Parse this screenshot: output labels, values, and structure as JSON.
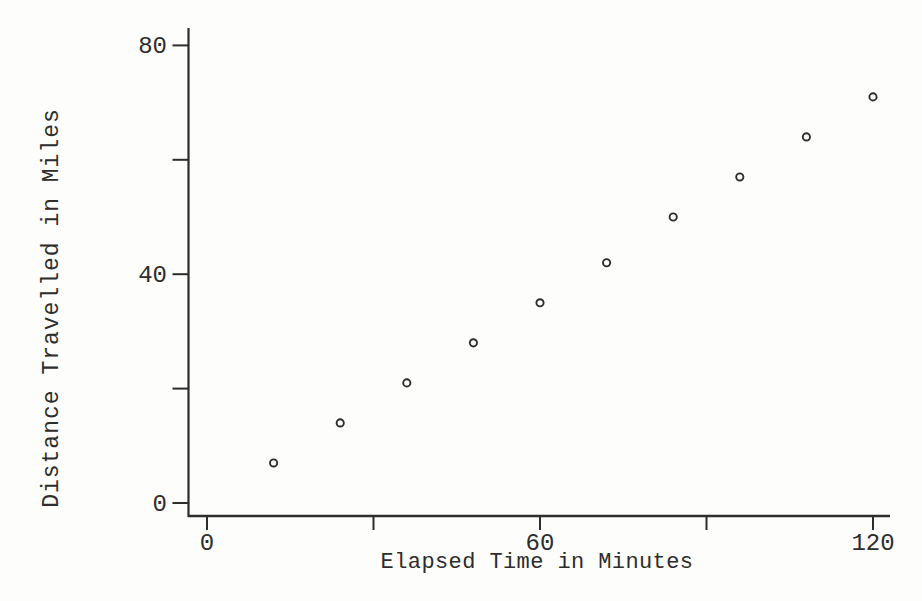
{
  "figure": {
    "background_color": "#fdfdfc",
    "ink_color": "#2d2d2d",
    "marker_style": "open-circle"
  },
  "chart_data": {
    "type": "scatter",
    "title": "",
    "xlabel": "Elapsed Time in Minutes",
    "ylabel": "Distance Travelled in Miles",
    "x": [
      12,
      24,
      36,
      48,
      60,
      72,
      84,
      96,
      108,
      120
    ],
    "y": [
      7,
      14,
      21,
      28,
      35,
      42,
      50,
      57,
      64,
      71
    ],
    "points": [
      [
        12,
        7
      ],
      [
        24,
        14
      ],
      [
        36,
        21
      ],
      [
        48,
        28
      ],
      [
        60,
        35
      ],
      [
        72,
        42
      ],
      [
        84,
        50
      ],
      [
        96,
        57
      ],
      [
        108,
        64
      ],
      [
        120,
        71
      ]
    ],
    "xlim": [
      0,
      123
    ],
    "ylim": [
      0,
      83
    ],
    "x_ticks": [
      {
        "value": 0,
        "label": "0"
      },
      {
        "value": 30,
        "label": ""
      },
      {
        "value": 60,
        "label": "60"
      },
      {
        "value": 90,
        "label": ""
      },
      {
        "value": 120,
        "label": "120"
      }
    ],
    "y_ticks": [
      {
        "value": 0,
        "label": "0"
      },
      {
        "value": 20,
        "label": ""
      },
      {
        "value": 40,
        "label": "40"
      },
      {
        "value": 60,
        "label": ""
      },
      {
        "value": 80,
        "label": "80"
      }
    ],
    "grid": false,
    "legend": null,
    "marker": "open-circle"
  }
}
